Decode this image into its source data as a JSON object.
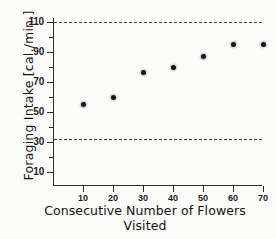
{
  "chart_data": {
    "type": "scatter",
    "title": "",
    "xlabel": "Consecutive Number of Flowers Visited",
    "xlabel_line1": "Consecutive Number of Flowers",
    "xlabel_line2": "Visited",
    "ylabel": "Foraging Intake [cal./min.]",
    "x": [
      10,
      20,
      30,
      40,
      50,
      60,
      70
    ],
    "y": [
      55,
      60,
      76.5,
      80,
      87,
      95,
      95
    ],
    "points": [
      {
        "x": 10,
        "y": 55
      },
      {
        "x": 20,
        "y": 60
      },
      {
        "x": 30,
        "y": 76.5
      },
      {
        "x": 40,
        "y": 80
      },
      {
        "x": 50,
        "y": 87
      },
      {
        "x": 60,
        "y": 95
      },
      {
        "x": 70,
        "y": 95
      }
    ],
    "xlim": [
      0,
      74
    ],
    "ylim": [
      3,
      121
    ],
    "xticks": [
      10,
      20,
      30,
      40,
      50,
      60,
      70
    ],
    "xtick_labels": [
      "10",
      "20",
      "30",
      "40",
      "50",
      "60",
      "70"
    ],
    "yticks": [
      10,
      30,
      50,
      70,
      90,
      110
    ],
    "ytick_labels": [
      "10",
      "30",
      "50",
      "70",
      "90",
      "110"
    ],
    "yticks_minor": [
      20,
      40,
      60,
      80,
      100
    ],
    "grid": false,
    "legend": null,
    "annotations": [
      {
        "kind": "hline",
        "value": 110,
        "style": "dashed",
        "label": "upper reference line"
      },
      {
        "kind": "hline",
        "value": 32,
        "style": "dashed",
        "label": "lower reference line"
      }
    ],
    "reference_lines": [
      110,
      32
    ],
    "marker": "filled-circle",
    "marker_color": "#141414",
    "axis_color": "#2b2b2b",
    "background_color": "#fbfbfa"
  }
}
